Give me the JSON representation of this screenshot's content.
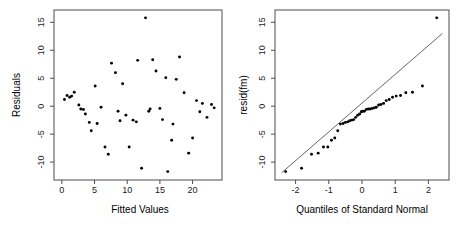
{
  "figure": {
    "background": "#ffffff",
    "point_color": "#000000",
    "axis_color": "#4d4d4d",
    "line_color": "#555555"
  },
  "chart_data": [
    {
      "type": "scatter",
      "panel": "left",
      "title": "",
      "xlabel": "Fitted Values",
      "ylabel": "Residuals",
      "xlim": [
        -1.2,
        24.5
      ],
      "ylim": [
        -13.2,
        17.2
      ],
      "xticks": [
        0,
        5,
        10,
        15,
        20
      ],
      "yticks": [
        -10,
        -5,
        0,
        5,
        10,
        15
      ],
      "xticklabels": [
        "0",
        "5",
        "10",
        "15",
        "20"
      ],
      "yticklabels": [
        "-10",
        "-5",
        "0",
        "5",
        "10",
        "15"
      ],
      "grid": false,
      "legend": "none",
      "x": [
        0.4,
        0.8,
        1.2,
        1.5,
        1.9,
        2.6,
        2.9,
        3.3,
        3.6,
        4.2,
        4.5,
        5.1,
        5.4,
        6.0,
        6.6,
        7.1,
        7.6,
        8.2,
        8.6,
        8.9,
        9.3,
        9.8,
        10.3,
        10.9,
        11.4,
        11.6,
        12.2,
        12.8,
        13.3,
        13.5,
        13.9,
        14.4,
        15.0,
        15.4,
        15.9,
        16.2,
        16.8,
        17.0,
        17.5,
        18.0,
        18.7,
        19.4,
        20.0,
        20.6,
        21.1,
        21.5,
        22.2,
        22.9,
        23.3
      ],
      "y": [
        1.2,
        1.9,
        1.6,
        1.8,
        2.5,
        0.2,
        -0.5,
        -0.6,
        -1.4,
        -2.9,
        -4.4,
        3.6,
        -3.1,
        -0.2,
        -7.3,
        -8.6,
        7.7,
        6.0,
        -0.9,
        -2.6,
        4.0,
        -1.6,
        -7.3,
        -2.5,
        -2.8,
        8.2,
        -11.1,
        15.8,
        -0.9,
        -0.5,
        8.3,
        6.3,
        -0.4,
        -2.4,
        5.1,
        -11.7,
        -6.1,
        -3.2,
        4.8,
        8.8,
        2.4,
        -8.4,
        -5.7,
        1.0,
        -1.0,
        0.5,
        -2.0,
        0.3,
        -0.3
      ]
    },
    {
      "type": "scatter",
      "panel": "right",
      "title": "",
      "xlabel": "Quantiles of Standard Normal",
      "ylabel": "resid(fm)",
      "xlim": [
        -2.62,
        2.62
      ],
      "ylim": [
        -13.2,
        17.2
      ],
      "xticks": [
        -2,
        -1,
        0,
        1,
        2
      ],
      "yticks": [
        -10,
        -5,
        0,
        5,
        10,
        15
      ],
      "xticklabels": [
        "-2",
        "-1",
        "0",
        "1",
        "2"
      ],
      "yticklabels": [
        "-10",
        "-5",
        "0",
        "5",
        "10",
        "15"
      ],
      "grid": false,
      "legend": "none",
      "reference_line": {
        "x1": -2.42,
        "y1": -11.9,
        "x2": 2.42,
        "y2": 13.0
      },
      "x": [
        -2.3,
        -1.82,
        -1.52,
        -1.32,
        -1.16,
        -1.03,
        -0.92,
        -0.82,
        -0.73,
        -0.65,
        -0.57,
        -0.5,
        -0.43,
        -0.37,
        -0.31,
        -0.25,
        -0.19,
        -0.13,
        -0.07,
        -0.02,
        0.02,
        0.07,
        0.13,
        0.19,
        0.25,
        0.31,
        0.37,
        0.43,
        0.5,
        0.57,
        0.65,
        0.73,
        0.82,
        0.92,
        1.03,
        1.16,
        1.32,
        1.52,
        1.82,
        2.25
      ],
      "y": [
        -11.7,
        -11.1,
        -8.6,
        -8.4,
        -7.3,
        -7.3,
        -6.1,
        -5.7,
        -4.4,
        -3.2,
        -3.1,
        -2.9,
        -2.8,
        -2.6,
        -2.5,
        -2.4,
        -2.0,
        -1.6,
        -1.4,
        -1.0,
        -0.9,
        -0.9,
        -0.6,
        -0.5,
        -0.5,
        -0.4,
        -0.3,
        -0.2,
        0.2,
        0.3,
        0.5,
        1.0,
        1.2,
        1.6,
        1.8,
        1.9,
        2.4,
        2.5,
        3.6,
        15.8
      ]
    }
  ]
}
